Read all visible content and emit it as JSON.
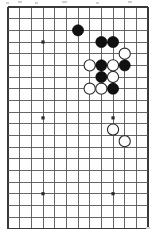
{
  "figure": {
    "kind": "go-board-diagram",
    "board": {
      "columns": 13,
      "rows": 20,
      "origin_x": 8,
      "origin_y": 7,
      "spacing": 11.67,
      "line_color": "#555555",
      "edge_color": "#3a3a3a",
      "background_color": "#ffffff",
      "stone_radius": 5.6
    },
    "star_points": [
      {
        "col": 3,
        "row": 3
      },
      {
        "col": 3,
        "row": 9.5
      },
      {
        "col": 9,
        "row": 9.5
      },
      {
        "col": 3,
        "row": 16
      },
      {
        "col": 9,
        "row": 16
      }
    ],
    "stones": [
      {
        "color": "black",
        "col": 6,
        "row": 2
      },
      {
        "color": "black",
        "col": 8,
        "row": 3
      },
      {
        "color": "black",
        "col": 9,
        "row": 3
      },
      {
        "color": "white",
        "col": 10,
        "row": 4
      },
      {
        "color": "white",
        "col": 7,
        "row": 5
      },
      {
        "color": "black",
        "col": 8,
        "row": 5
      },
      {
        "color": "white",
        "col": 9,
        "row": 5
      },
      {
        "color": "black",
        "col": 10,
        "row": 5
      },
      {
        "color": "black",
        "col": 8,
        "row": 6
      },
      {
        "color": "white",
        "col": 9,
        "row": 6
      },
      {
        "color": "white",
        "col": 7,
        "row": 7
      },
      {
        "color": "white",
        "col": 8,
        "row": 7
      },
      {
        "color": "black",
        "col": 9,
        "row": 7
      },
      {
        "color": "white",
        "col": 9,
        "row": 10.5
      },
      {
        "color": "white",
        "col": 10,
        "row": 11.5
      }
    ],
    "counts": {
      "black_stones": 7,
      "white_stones": 8,
      "total_stones": 15
    },
    "specks": [
      {
        "x": 6,
        "y": 2,
        "w": 3,
        "h": 2
      },
      {
        "x": 18,
        "y": 1,
        "w": 4,
        "h": 2
      },
      {
        "x": 35,
        "y": 2,
        "w": 3,
        "h": 2
      },
      {
        "x": 62,
        "y": 1,
        "w": 5,
        "h": 2
      },
      {
        "x": 96,
        "y": 2,
        "w": 3,
        "h": 2
      },
      {
        "x": 128,
        "y": 1,
        "w": 4,
        "h": 2
      },
      {
        "x": 146,
        "y": 227,
        "w": 4,
        "h": 2
      }
    ]
  }
}
